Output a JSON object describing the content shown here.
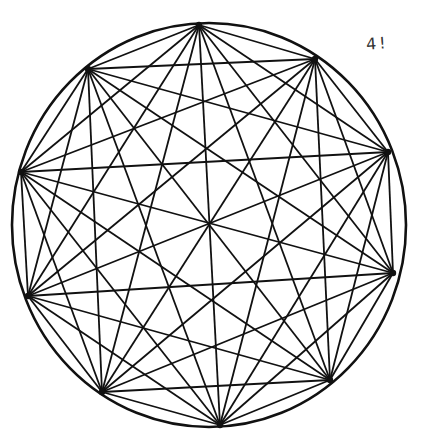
{
  "diagram": {
    "type": "complete-graph-in-circle",
    "annotation": "4!",
    "circle": {
      "cx": 209,
      "cy": 225,
      "rx": 197,
      "ry": 202
    },
    "stroke_color": "#111111",
    "vertices": [
      {
        "x": 199,
        "y": 25
      },
      {
        "x": 315,
        "y": 59
      },
      {
        "x": 388,
        "y": 152
      },
      {
        "x": 393,
        "y": 273
      },
      {
        "x": 330,
        "y": 380
      },
      {
        "x": 220,
        "y": 425
      },
      {
        "x": 102,
        "y": 392
      },
      {
        "x": 28,
        "y": 296
      },
      {
        "x": 21,
        "y": 172
      },
      {
        "x": 88,
        "y": 69
      }
    ]
  }
}
